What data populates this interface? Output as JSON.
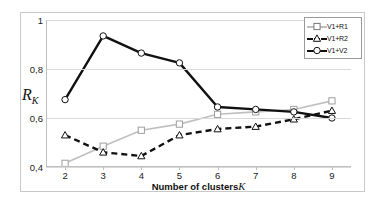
{
  "chart_data": {
    "type": "line",
    "title": "",
    "xlabel": "Number of clusters  K",
    "xlabel_main": "Number of clusters",
    "xlabel_symbol": "K",
    "ylabel": "R_K",
    "ylabel_main": "R",
    "ylabel_sub": "K",
    "x": [
      2,
      3,
      4,
      5,
      6,
      7,
      8,
      9
    ],
    "categories": [
      "2",
      "3",
      "4",
      "5",
      "6",
      "7",
      "8",
      "9"
    ],
    "xlim": [
      1.5,
      9.5
    ],
    "ylim": [
      0.4,
      1.0
    ],
    "yticks": [
      0.4,
      0.6,
      0.8,
      1.0
    ],
    "ytick_labels": [
      "0,4",
      "0,6",
      "0,8",
      "1"
    ],
    "grid": "horizontal",
    "legend_position": "top-right",
    "series": [
      {
        "name": "V1+R1",
        "values": [
          0.415,
          0.485,
          0.55,
          0.575,
          0.615,
          0.625,
          0.635,
          0.67
        ],
        "color": "#bfbfbf",
        "marker": "square",
        "linestyle": "solid"
      },
      {
        "name": "V1+R2",
        "values": [
          0.53,
          0.46,
          0.445,
          0.53,
          0.555,
          0.565,
          0.595,
          0.63
        ],
        "color": "#111111",
        "marker": "triangle",
        "linestyle": "dashed"
      },
      {
        "name": "V1+V2",
        "values": [
          0.675,
          0.935,
          0.865,
          0.825,
          0.645,
          0.635,
          0.625,
          0.6
        ],
        "color": "#111111",
        "marker": "circle",
        "linestyle": "solid"
      }
    ]
  },
  "legend": {
    "entries": [
      {
        "label": "V1+R1"
      },
      {
        "label": "V1+R2"
      },
      {
        "label": "V1+V2"
      }
    ]
  }
}
